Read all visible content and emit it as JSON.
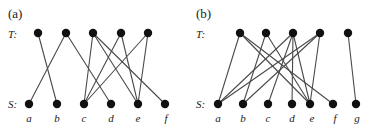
{
  "figure": {
    "width": 385,
    "height": 131,
    "background": "#ffffff",
    "node_color": "#111111",
    "edge_color": "#4a4a4a",
    "text_color": "#1a1a1a"
  },
  "panels": [
    {
      "id": "a",
      "label": "(a)",
      "label_pos": {
        "x": 8,
        "y": 18
      },
      "top_row_label": "T:",
      "top_row_label_pos": {
        "x": 8,
        "y": 38
      },
      "bottom_row_label": "S:",
      "bottom_row_label_pos": {
        "x": 8,
        "y": 108
      },
      "top_nodes": [
        {
          "id": "t1",
          "x": 38,
          "y": 33,
          "r": 4.2
        },
        {
          "id": "t2",
          "x": 66,
          "y": 33,
          "r": 4.2
        },
        {
          "id": "t3",
          "x": 93,
          "y": 33,
          "r": 4.2
        },
        {
          "id": "t4",
          "x": 121,
          "y": 33,
          "r": 4.2
        },
        {
          "id": "t5",
          "x": 148,
          "y": 33,
          "r": 4.2
        }
      ],
      "bottom_nodes": [
        {
          "id": "a",
          "label": "a",
          "x": 29,
          "y": 104,
          "r": 4.2,
          "label_x": 29,
          "label_y": 122
        },
        {
          "id": "b",
          "label": "b",
          "x": 57,
          "y": 104,
          "r": 4.2,
          "label_x": 57,
          "label_y": 122
        },
        {
          "id": "c",
          "label": "c",
          "x": 84,
          "y": 104,
          "r": 4.2,
          "label_x": 84,
          "label_y": 122
        },
        {
          "id": "d",
          "label": "d",
          "x": 111,
          "y": 104,
          "r": 4.2,
          "label_x": 111,
          "label_y": 122
        },
        {
          "id": "e",
          "label": "e",
          "x": 138,
          "y": 104,
          "r": 4.2,
          "label_x": 138,
          "label_y": 122
        },
        {
          "id": "f",
          "label": "f",
          "x": 165,
          "y": 104,
          "r": 4.2,
          "label_x": 166,
          "label_y": 122
        }
      ],
      "edges": [
        {
          "from": "t1",
          "to": "b"
        },
        {
          "from": "t2",
          "to": "a"
        },
        {
          "from": "t2",
          "to": "d"
        },
        {
          "from": "t3",
          "to": "c"
        },
        {
          "from": "t3",
          "to": "e"
        },
        {
          "from": "t4",
          "to": "c"
        },
        {
          "from": "t4",
          "to": "e"
        },
        {
          "from": "t5",
          "to": "e"
        },
        {
          "from": "t5",
          "to": "c"
        },
        {
          "from": "t3",
          "to": "f"
        }
      ]
    },
    {
      "id": "b",
      "label": "(b)",
      "label_pos": {
        "x": 196,
        "y": 18
      },
      "top_row_label": "T:",
      "top_row_label_pos": {
        "x": 196,
        "y": 38
      },
      "bottom_row_label": "S:",
      "bottom_row_label_pos": {
        "x": 196,
        "y": 108
      },
      "top_nodes": [
        {
          "id": "t1",
          "x": 240,
          "y": 33,
          "r": 4.2
        },
        {
          "id": "t2",
          "x": 266,
          "y": 33,
          "r": 4.2
        },
        {
          "id": "t3",
          "x": 293,
          "y": 33,
          "r": 4.2
        },
        {
          "id": "t4",
          "x": 320,
          "y": 33,
          "r": 4.2
        },
        {
          "id": "t5",
          "x": 348,
          "y": 33,
          "r": 4.2
        }
      ],
      "bottom_nodes": [
        {
          "id": "a",
          "label": "a",
          "x": 218,
          "y": 104,
          "r": 4.2,
          "label_x": 218,
          "label_y": 122
        },
        {
          "id": "b",
          "label": "b",
          "x": 243,
          "y": 104,
          "r": 4.2,
          "label_x": 243,
          "label_y": 122
        },
        {
          "id": "c",
          "label": "c",
          "x": 268,
          "y": 104,
          "r": 4.2,
          "label_x": 268,
          "label_y": 122
        },
        {
          "id": "d",
          "label": "d",
          "x": 292,
          "y": 104,
          "r": 4.2,
          "label_x": 292,
          "label_y": 122
        },
        {
          "id": "e",
          "label": "e",
          "x": 310,
          "y": 104,
          "r": 4.2,
          "label_x": 312,
          "label_y": 122
        },
        {
          "id": "f",
          "label": "f",
          "x": 333,
          "y": 104,
          "r": 4.2,
          "label_x": 335,
          "label_y": 122
        },
        {
          "id": "g",
          "label": "g",
          "x": 356,
          "y": 104,
          "r": 4.2,
          "label_x": 357,
          "label_y": 122
        }
      ],
      "edges": [
        {
          "from": "t1",
          "to": "a"
        },
        {
          "from": "t1",
          "to": "e"
        },
        {
          "from": "t1",
          "to": "f"
        },
        {
          "from": "t2",
          "to": "b"
        },
        {
          "from": "t2",
          "to": "e"
        },
        {
          "from": "t3",
          "to": "a"
        },
        {
          "from": "t3",
          "to": "c"
        },
        {
          "from": "t3",
          "to": "d"
        },
        {
          "from": "t3",
          "to": "e"
        },
        {
          "from": "t4",
          "to": "b"
        },
        {
          "from": "t4",
          "to": "e"
        },
        {
          "from": "t5",
          "to": "g"
        },
        {
          "from": "t4",
          "to": "a"
        }
      ]
    }
  ]
}
